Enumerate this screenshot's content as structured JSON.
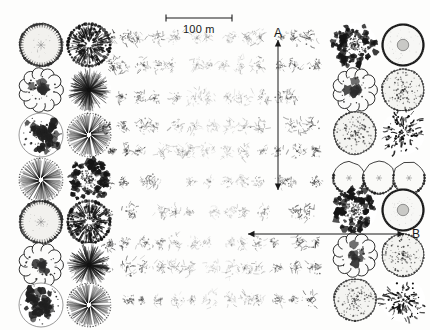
{
  "figure": {
    "type": "forest-stand-map",
    "background_color": "#fdfdfc",
    "ink_color": "#1a1a1a",
    "width": 430,
    "height": 330
  },
  "scale_bar": {
    "label": "100 m",
    "x_start": 166,
    "x_end": 232,
    "y": 18,
    "tick_height": 7
  },
  "transects": [
    {
      "name": "A",
      "label": "A",
      "orientation": "vertical",
      "double_headed": true,
      "x": 278,
      "y_start": 40,
      "y_end": 190,
      "label_x": 274,
      "label_y": 27
    },
    {
      "name": "B",
      "label": "B",
      "orientation": "horizontal",
      "double_headed": true,
      "y": 234,
      "x_start": 248,
      "x_end": 404,
      "label_x": 412,
      "label_y": 228
    }
  ],
  "canopy_styles": [
    {
      "id": "scalloped-pale",
      "name": "scalloped-outline-pale-fill"
    },
    {
      "id": "radial-speckle",
      "name": "dark-radial-speckled"
    },
    {
      "id": "cloud-blob",
      "name": "cloud-lobed-outline"
    },
    {
      "id": "radial-burst",
      "name": "fine-radial-burst"
    },
    {
      "id": "mottled-dark",
      "name": "mottled-dark-clumps"
    },
    {
      "id": "radial-fan",
      "name": "open-radial-fan"
    },
    {
      "id": "dense-rosette",
      "name": "dense-dark-rosette"
    },
    {
      "id": "ring-dot",
      "name": "beaded-ring-with-core"
    },
    {
      "id": "stipple-light",
      "name": "light-stippled-disc"
    },
    {
      "id": "scribble-dark",
      "name": "dark-scribble-crown"
    }
  ],
  "left_panel": {
    "columns": 2,
    "rows": 7,
    "col_x": [
      41,
      89
    ],
    "row_y": [
      45,
      90,
      135,
      180,
      222,
      265,
      305
    ],
    "radius": 22,
    "style_grid": [
      [
        "scalloped-pale",
        "radial-speckle"
      ],
      [
        "cloud-blob",
        "radial-burst"
      ],
      [
        "mottled-dark",
        "radial-fan"
      ],
      [
        "radial-fan",
        "dense-rosette"
      ],
      [
        "scalloped-pale",
        "radial-speckle"
      ],
      [
        "cloud-blob",
        "radial-burst"
      ],
      [
        "mottled-dark",
        "radial-fan"
      ]
    ]
  },
  "right_panel": {
    "columns": 2,
    "rows": 7,
    "col_x": [
      355,
      403
    ],
    "row_y": [
      45,
      90,
      133,
      178,
      210,
      255,
      300
    ],
    "radius": 22,
    "style_grid": [
      [
        "dense-rosette",
        "ring-dot"
      ],
      [
        "cloud-blob",
        "stipple-light"
      ],
      [
        "stipple-light",
        "scribble-dark"
      ],
      [
        "triple-scalloped",
        "triple-scalloped"
      ],
      [
        "dense-rosette",
        "ring-dot"
      ],
      [
        "cloud-blob",
        "stipple-light"
      ],
      [
        "stipple-light",
        "scribble-dark"
      ]
    ],
    "triple_row_index": 3,
    "triple_row_centers": [
      349,
      379,
      409
    ],
    "triple_row_radius": 17
  },
  "center_field": {
    "description": "dense grid of small sketchy tree-crown symbols, darker at left and right margins, fading toward the middle",
    "x_start": 108,
    "x_end": 322,
    "y_start": 38,
    "y_end": 322,
    "rows": 10,
    "cols": 13,
    "row_spacing": 29,
    "col_spacing": 17,
    "symbol_radius": 8,
    "opacity_edge": 0.85,
    "opacity_center": 0.2
  }
}
